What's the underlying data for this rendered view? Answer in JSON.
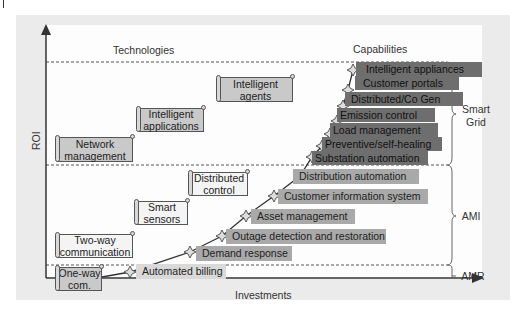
{
  "axes": {
    "y_label": "ROI",
    "x_label": "Investments"
  },
  "headers": {
    "technologies": "Technologies",
    "capabilities": "Capabilities"
  },
  "technologies": [
    {
      "label_line1": "One-way",
      "label_line2": "com.",
      "shade": "gray"
    },
    {
      "label_line1": "Two-way",
      "label_line2": "communication",
      "shade": "light"
    },
    {
      "label_line1": "Smart",
      "label_line2": "sensors",
      "shade": "light"
    },
    {
      "label_line1": "Distributed",
      "label_line2": "control",
      "shade": "light"
    },
    {
      "label_line1": "Network",
      "label_line2": "management",
      "shade": "gray"
    },
    {
      "label_line1": "Intelligent",
      "label_line2": "applications",
      "shade": "gray"
    },
    {
      "label_line1": "Intelligent",
      "label_line2": "agents",
      "shade": "gray"
    }
  ],
  "capabilities": [
    {
      "label": "Automated billing",
      "tier": "AMR"
    },
    {
      "label": "Demand response",
      "tier": "AMI"
    },
    {
      "label": "Outage detection and restoration",
      "tier": "AMI"
    },
    {
      "label": "Asset management",
      "tier": "AMI"
    },
    {
      "label": "Customer information system",
      "tier": "AMI"
    },
    {
      "label": "Distribution automation",
      "tier": "AMI"
    },
    {
      "label": "Substation automation",
      "tier": "Smart Grid"
    },
    {
      "label": "Preventive/self-healing",
      "tier": "Smart Grid"
    },
    {
      "label": "Load management",
      "tier": "Smart Grid"
    },
    {
      "label": "Emission control",
      "tier": "Smart Grid"
    },
    {
      "label": "Distributed/Co Gen",
      "tier": "Smart Grid"
    },
    {
      "label": "Customer portals",
      "tier": "Smart Grid"
    },
    {
      "label": "Intelligent appliances",
      "tier": "Smart Grid"
    }
  ],
  "tiers": [
    {
      "label_line1": "Smart",
      "label_line2": "Grid"
    },
    {
      "label_line1": "AMI",
      "label_line2": ""
    },
    {
      "label_line1": "AMR",
      "label_line2": ""
    }
  ],
  "colors": {
    "panel_bg": "#ebebeb",
    "plot_bg": "#fdfdfd",
    "smart_grid_bar": "#6e6e6e",
    "ami_bar": "#a9a9a9",
    "amr_bar": "#d9d9d9",
    "axis": "#333333"
  }
}
